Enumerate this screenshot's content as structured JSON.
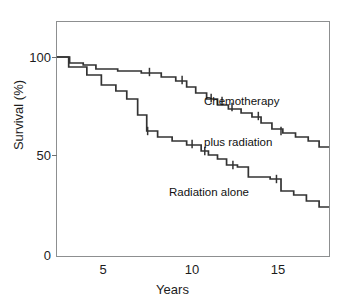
{
  "figure": {
    "caption_ghost": "",
    "background_color": "#ffffff",
    "frame_color": "#8d8f90",
    "curve_color": "#333333"
  },
  "axes": {
    "y": {
      "label": "Survival (%)",
      "ticks": [
        "100",
        "50",
        "0"
      ],
      "tick_values": [
        100,
        50,
        0
      ],
      "range": [
        0,
        118
      ]
    },
    "x": {
      "label": "Years",
      "ticks": [
        "5",
        "10",
        "15"
      ],
      "tick_values": [
        5,
        10,
        15
      ],
      "range": [
        2.4,
        17.5
      ]
    }
  },
  "annotations": {
    "chemo_line1": "Chemotherapy",
    "chemo_line2": "plus radiation",
    "radiation": "Radiation alone"
  },
  "chart_data": {
    "type": "line",
    "subtype": "kaplan-meier-step",
    "title": "",
    "xlabel": "Years",
    "ylabel": "Survival (%)",
    "xlim": [
      2.4,
      17.5
    ],
    "ylim": [
      0,
      118
    ],
    "xticks": [
      5,
      10,
      15
    ],
    "yticks": [
      0,
      50,
      100
    ],
    "grid": false,
    "legend": "in-plot annotations",
    "series": [
      {
        "name": "Chemotherapy plus radiation",
        "color": "#333333",
        "points": [
          [
            2.45,
            100
          ],
          [
            3.15,
            100
          ],
          [
            3.15,
            97
          ],
          [
            3.9,
            97
          ],
          [
            3.9,
            96
          ],
          [
            4.6,
            96
          ],
          [
            4.6,
            94
          ],
          [
            5.8,
            94
          ],
          [
            5.8,
            93
          ],
          [
            7.1,
            93
          ],
          [
            7.1,
            92
          ],
          [
            8.2,
            92
          ],
          [
            8.2,
            90
          ],
          [
            9.0,
            90
          ],
          [
            9.0,
            88
          ],
          [
            9.6,
            88
          ],
          [
            9.6,
            85
          ],
          [
            10.1,
            85
          ],
          [
            10.1,
            82
          ],
          [
            10.7,
            82
          ],
          [
            10.7,
            79
          ],
          [
            11.3,
            79
          ],
          [
            11.3,
            76
          ],
          [
            11.9,
            76
          ],
          [
            11.9,
            74
          ],
          [
            12.6,
            74
          ],
          [
            12.6,
            72
          ],
          [
            13.2,
            72
          ],
          [
            13.2,
            70
          ],
          [
            13.7,
            70
          ],
          [
            13.7,
            67
          ],
          [
            14.3,
            67
          ],
          [
            14.3,
            64
          ],
          [
            14.9,
            64
          ],
          [
            14.9,
            62
          ],
          [
            15.6,
            62
          ],
          [
            15.6,
            60
          ],
          [
            16.3,
            60
          ],
          [
            16.3,
            58
          ],
          [
            16.9,
            58
          ],
          [
            16.9,
            55
          ],
          [
            17.45,
            55
          ]
        ],
        "censor_marks": [
          [
            7.55,
            92.5
          ],
          [
            9.35,
            88.5
          ],
          [
            10.95,
            79.5
          ],
          [
            11.55,
            78
          ],
          [
            12.1,
            75
          ],
          [
            13.55,
            70.5
          ],
          [
            14.8,
            63
          ]
        ],
        "start_value": 100,
        "end_value": 55
      },
      {
        "name": "Radiation alone",
        "color": "#333333",
        "points": [
          [
            2.45,
            100
          ],
          [
            3.1,
            100
          ],
          [
            3.1,
            95
          ],
          [
            4.1,
            95
          ],
          [
            4.1,
            91
          ],
          [
            4.9,
            91
          ],
          [
            4.9,
            86
          ],
          [
            5.7,
            86
          ],
          [
            5.7,
            83
          ],
          [
            6.3,
            83
          ],
          [
            6.3,
            79
          ],
          [
            6.9,
            79
          ],
          [
            6.9,
            71
          ],
          [
            7.4,
            71
          ],
          [
            7.4,
            63
          ],
          [
            8.0,
            63
          ],
          [
            8.0,
            60
          ],
          [
            8.8,
            60
          ],
          [
            8.8,
            58
          ],
          [
            9.6,
            58
          ],
          [
            9.6,
            56
          ],
          [
            10.4,
            56
          ],
          [
            10.4,
            53
          ],
          [
            10.8,
            53
          ],
          [
            10.8,
            51
          ],
          [
            11.3,
            51
          ],
          [
            11.3,
            49
          ],
          [
            11.8,
            49
          ],
          [
            11.8,
            46
          ],
          [
            12.4,
            46
          ],
          [
            12.4,
            45
          ],
          [
            13.0,
            45
          ],
          [
            13.0,
            40
          ],
          [
            14.2,
            40
          ],
          [
            14.2,
            39
          ],
          [
            14.8,
            39
          ],
          [
            14.8,
            33
          ],
          [
            15.5,
            33
          ],
          [
            15.5,
            31
          ],
          [
            16.2,
            31
          ],
          [
            16.2,
            28
          ],
          [
            16.9,
            28
          ],
          [
            16.9,
            25
          ],
          [
            17.45,
            25
          ]
        ],
        "censor_marks": [
          [
            7.45,
            63
          ],
          [
            9.9,
            56.5
          ],
          [
            10.6,
            53
          ],
          [
            12.15,
            46
          ],
          [
            14.55,
            39
          ]
        ],
        "start_value": 100,
        "end_value": 25
      }
    ]
  }
}
